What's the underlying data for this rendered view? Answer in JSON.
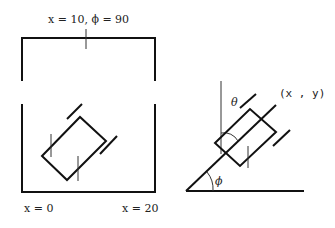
{
  "diagram": {
    "left_panel": {
      "top_label": "x = 10, ϕ = 90",
      "bottom_left_label": "x = 0",
      "bottom_right_label": "x = 20"
    },
    "right_panel": {
      "position_label": "(x , y)",
      "theta_label": "θ",
      "phi_label": "ϕ"
    }
  }
}
